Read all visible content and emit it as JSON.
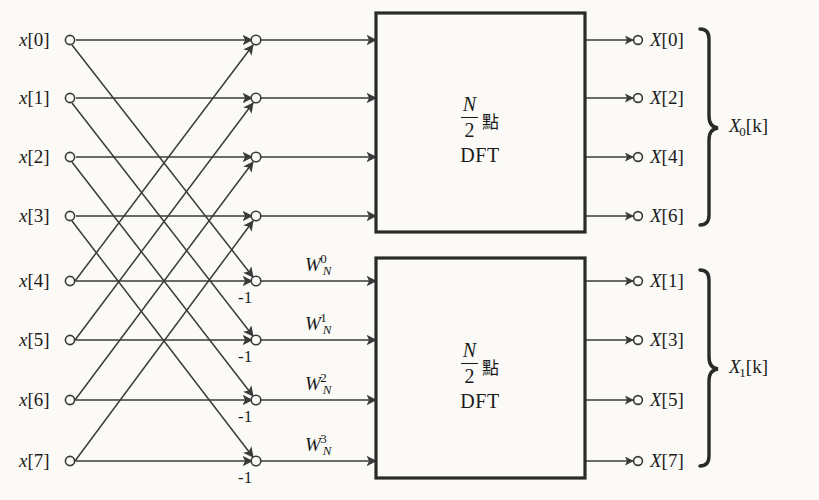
{
  "figure": {
    "colors": {
      "ink": "#1a1a1a",
      "background": "#fbfaf7",
      "line": "#3a3a3a"
    }
  },
  "inputs": [
    {
      "label": "x[0]",
      "var": "x",
      "index": "[0]",
      "y": 40
    },
    {
      "label": "x[1]",
      "var": "x",
      "index": "[1]",
      "y": 98
    },
    {
      "label": "x[2]",
      "var": "x",
      "index": "[2]",
      "y": 157
    },
    {
      "label": "x[3]",
      "var": "x",
      "index": "[3]",
      "y": 216
    },
    {
      "label": "x[4]",
      "var": "x",
      "index": "[4]",
      "y": 281
    },
    {
      "label": "x[5]",
      "var": "x",
      "index": "[5]",
      "y": 340
    },
    {
      "label": "x[6]",
      "var": "x",
      "index": "[6]",
      "y": 400
    },
    {
      "label": "x[7]",
      "var": "x",
      "index": "[7]",
      "y": 461
    }
  ],
  "outputs": [
    {
      "label": "X[0]",
      "var": "X",
      "index": "[0]",
      "y": 40
    },
    {
      "label": "X[2]",
      "var": "X",
      "index": "[2]",
      "y": 98
    },
    {
      "label": "X[4]",
      "var": "X",
      "index": "[4]",
      "y": 157
    },
    {
      "label": "X[6]",
      "var": "X",
      "index": "[6]",
      "y": 216
    },
    {
      "label": "X[1]",
      "var": "X",
      "index": "[1]",
      "y": 281
    },
    {
      "label": "X[3]",
      "var": "X",
      "index": "[3]",
      "y": 340
    },
    {
      "label": "X[5]",
      "var": "X",
      "index": "[5]",
      "y": 400
    },
    {
      "label": "X[7]",
      "var": "X",
      "index": "[7]",
      "y": 461
    }
  ],
  "twiddles": [
    {
      "base": "W",
      "sub": "N",
      "sup": "0",
      "label": "W_N^0",
      "y": 281
    },
    {
      "base": "W",
      "sub": "N",
      "sup": "1",
      "label": "W_N^1",
      "y": 340
    },
    {
      "base": "W",
      "sub": "N",
      "sup": "2",
      "label": "W_N^2",
      "y": 400
    },
    {
      "base": "W",
      "sub": "N",
      "sup": "3",
      "label": "W_N^3",
      "y": 461
    }
  ],
  "negative_ones": [
    {
      "label": "-1",
      "y": 281
    },
    {
      "label": "-1",
      "y": 340
    },
    {
      "label": "-1",
      "y": 400
    },
    {
      "label": "-1",
      "y": 461
    }
  ],
  "dft_boxes": [
    {
      "name": "upper-dft-block",
      "numerator": "N",
      "denominator": "2",
      "unit": "點",
      "transform": "DFT",
      "text": "N/2 點 DFT"
    },
    {
      "name": "lower-dft-block",
      "numerator": "N",
      "denominator": "2",
      "unit": "點",
      "transform": "DFT",
      "text": "N/2 點 DFT"
    }
  ],
  "groups": [
    {
      "label": "X0[k]",
      "var": "X",
      "sub": "0",
      "index": "[k]",
      "name": "even-output-group"
    },
    {
      "label": "X1[k]",
      "var": "X",
      "sub": "1",
      "index": "[k]",
      "name": "odd-output-group"
    }
  ]
}
